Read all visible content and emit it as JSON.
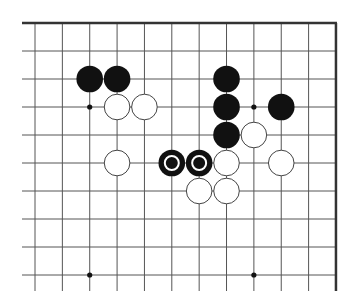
{
  "diagram": {
    "type": "go-board-fragment",
    "colors": {
      "background": "#ffffff",
      "grid_line": "#555555",
      "edge_line": "#333333",
      "black_stone": "#111111",
      "white_stone_fill": "#ffffff",
      "white_stone_stroke": "#444444",
      "marker": "#ffffff"
    },
    "grid": {
      "columns": 12,
      "rows": 10,
      "x0": 35,
      "dx": 27.36,
      "y0": 23,
      "dy": 28,
      "line_left_start": 22,
      "line_bottom_end": 291,
      "top_edge": true,
      "right_edge": true,
      "left_edge": false,
      "bottom_edge": false
    },
    "star_points": [
      {
        "col": 2,
        "row": 3
      },
      {
        "col": 8,
        "row": 3
      },
      {
        "col": 2,
        "row": 9
      },
      {
        "col": 8,
        "row": 9
      }
    ],
    "stones": [
      {
        "color": "black",
        "col": 2,
        "row": 2,
        "marked": false
      },
      {
        "color": "black",
        "col": 3,
        "row": 2,
        "marked": false
      },
      {
        "color": "white",
        "col": 3,
        "row": 3,
        "marked": false
      },
      {
        "color": "white",
        "col": 4,
        "row": 3,
        "marked": false
      },
      {
        "color": "black",
        "col": 7,
        "row": 2,
        "marked": false
      },
      {
        "color": "black",
        "col": 7,
        "row": 3,
        "marked": false
      },
      {
        "color": "black",
        "col": 7,
        "row": 4,
        "marked": false
      },
      {
        "color": "black",
        "col": 9,
        "row": 3,
        "marked": false
      },
      {
        "color": "white",
        "col": 8,
        "row": 4,
        "marked": false
      },
      {
        "color": "white",
        "col": 3,
        "row": 5,
        "marked": false
      },
      {
        "color": "black",
        "col": 5,
        "row": 5,
        "marked": true
      },
      {
        "color": "black",
        "col": 6,
        "row": 5,
        "marked": true
      },
      {
        "color": "white",
        "col": 7,
        "row": 5,
        "marked": false
      },
      {
        "color": "white",
        "col": 9,
        "row": 5,
        "marked": false
      },
      {
        "color": "white",
        "col": 6,
        "row": 6,
        "marked": false
      },
      {
        "color": "white",
        "col": 7,
        "row": 6,
        "marked": false
      }
    ],
    "stone_radius": 13.3,
    "marker_radius": 7
  }
}
